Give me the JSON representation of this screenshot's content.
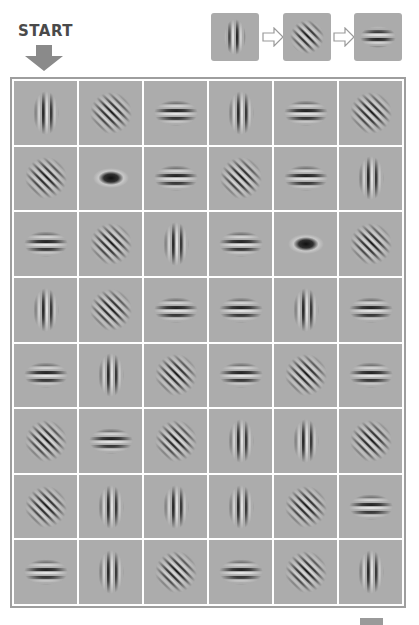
{
  "start": {
    "label": "START"
  },
  "legend": {
    "sequence": [
      "vertical",
      "diagonal",
      "horizontal"
    ],
    "description": "vertical → diagonal → horizontal"
  },
  "colors": {
    "cell_bg": "#acacac",
    "grid_line": "#ffffff",
    "arrow": "#8a8a8a",
    "stripe_dark": "#1a1a1a",
    "stripe_light": "#e0e0e0"
  },
  "grid": {
    "rows": 8,
    "cols": 6,
    "cells": [
      [
        "vertical",
        "diagonal",
        "horizontal",
        "vertical",
        "horizontal",
        "diagonal"
      ],
      [
        "diagonal",
        "blob",
        "horizontal",
        "diagonal",
        "horizontal",
        "vertical"
      ],
      [
        "horizontal",
        "diagonal",
        "vertical",
        "horizontal",
        "blob",
        "diagonal"
      ],
      [
        "vertical",
        "diagonal",
        "horizontal",
        "horizontal",
        "vertical",
        "horizontal"
      ],
      [
        "horizontal",
        "vertical",
        "diagonal",
        "horizontal",
        "diagonal",
        "horizontal"
      ],
      [
        "diagonal",
        "horizontal",
        "diagonal",
        "vertical",
        "vertical",
        "diagonal"
      ],
      [
        "diagonal",
        "vertical",
        "vertical",
        "vertical",
        "diagonal",
        "horizontal"
      ],
      [
        "horizontal",
        "vertical",
        "diagonal",
        "horizontal",
        "diagonal",
        "vertical"
      ]
    ]
  }
}
